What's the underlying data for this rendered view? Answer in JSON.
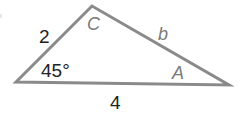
{
  "figure": {
    "type": "triangle",
    "vertices": {
      "B": {
        "x": 16,
        "y": 82
      },
      "C": {
        "x": 92,
        "y": 6
      },
      "A": {
        "x": 229,
        "y": 85
      }
    },
    "stroke_color": "#8a8a8a",
    "stroke_width": 3
  },
  "labels": {
    "vertex_C": "C",
    "vertex_A": "A",
    "side_BC": "2",
    "side_CA": "b",
    "side_BA": "4",
    "angle_B": "45°"
  },
  "colors": {
    "line": "#8a8a8a",
    "number_text": "#222222",
    "variable_text": "#7a7a7a",
    "background": "#ffffff"
  }
}
